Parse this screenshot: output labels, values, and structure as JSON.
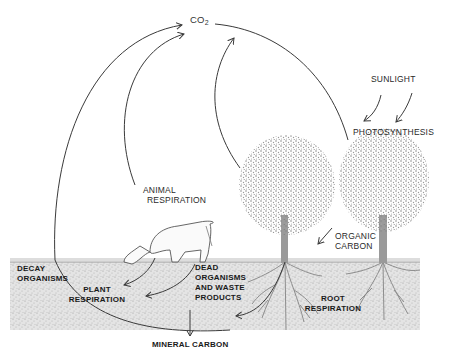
{
  "diagram": {
    "labels": {
      "co2_main": "CO",
      "co2_sub": "2",
      "sunlight": "SUNLIGHT",
      "photosynthesis": "PHOTOSYNTHESIS",
      "animal_respiration_1": "ANIMAL",
      "animal_respiration_2": "RESPIRATION",
      "organic_carbon_1": "ORGANIC",
      "organic_carbon_2": "CARBON",
      "decay_organisms_1": "DECAY",
      "decay_organisms_2": "ORGANISMS",
      "plant_respiration_1": "PLANT",
      "plant_respiration_2": "RESPIRATION",
      "dead_organisms_1": "DEAD",
      "dead_organisms_2": "ORGANISMS",
      "dead_organisms_3": "AND WASTE",
      "dead_organisms_4": "PRODUCTS",
      "root_respiration_1": "ROOT",
      "root_respiration_2": "RESPIRATION",
      "mineral_carbon": "MINERAL CARBON"
    },
    "colors": {
      "line": "#3a3a3a",
      "soil": "#d4d4d4",
      "foliage": "#8a8a8a",
      "text": "#2a2a2a"
    }
  }
}
